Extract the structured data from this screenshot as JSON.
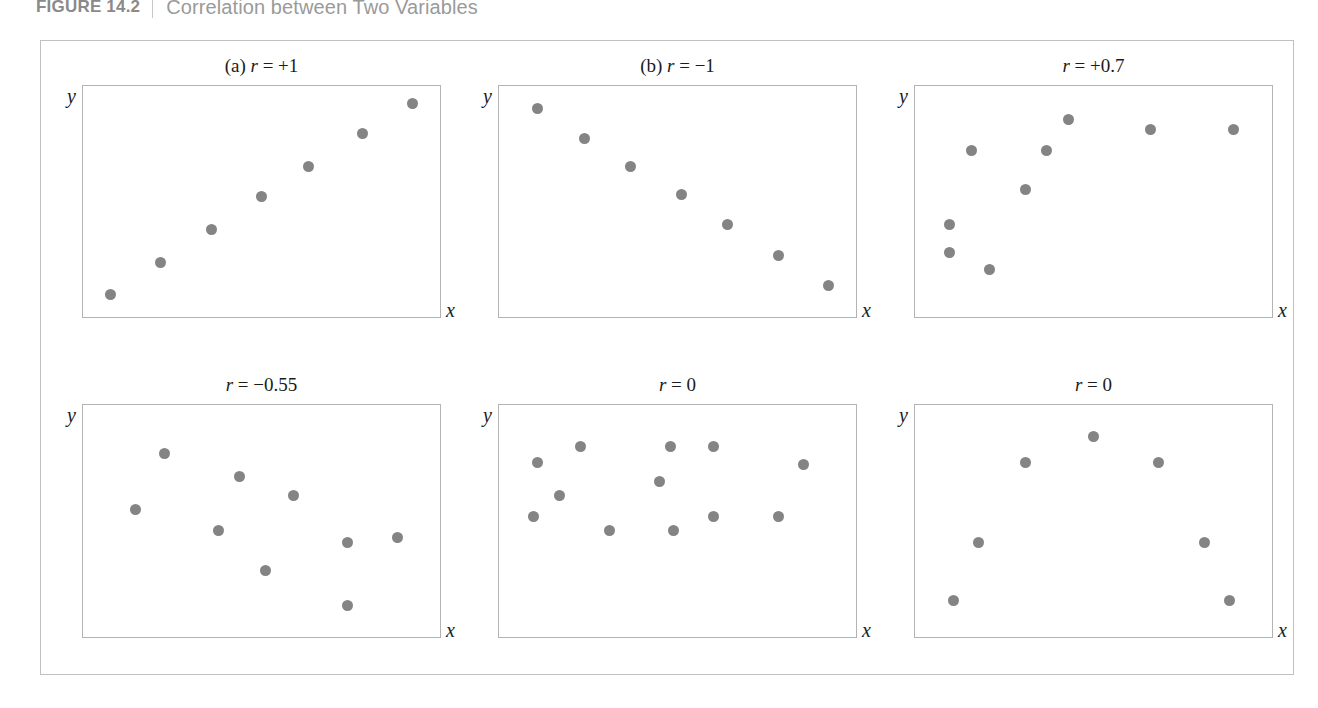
{
  "header": {
    "figure_label": "FIGURE 14.2",
    "title": "Correlation between Two Variables"
  },
  "axes": {
    "x_label": "x",
    "y_label": "y"
  },
  "chart_data": [
    {
      "type": "scatter",
      "panel_id": "panel-a",
      "title": "(a) r = +1",
      "r": "+1",
      "xlabel": "x",
      "ylabel": "y",
      "xlim": [
        0,
        100
      ],
      "ylim": [
        0,
        100
      ],
      "grid": false,
      "legend": "none",
      "points": [
        {
          "x": 8,
          "y": 10
        },
        {
          "x": 22,
          "y": 24
        },
        {
          "x": 36,
          "y": 38
        },
        {
          "x": 50,
          "y": 52
        },
        {
          "x": 63,
          "y": 65
        },
        {
          "x": 78,
          "y": 79
        },
        {
          "x": 92,
          "y": 92
        }
      ]
    },
    {
      "type": "scatter",
      "panel_id": "panel-b",
      "title": "(b) r = −1",
      "r": "−1",
      "xlabel": "x",
      "ylabel": "y",
      "xlim": [
        0,
        100
      ],
      "ylim": [
        0,
        100
      ],
      "grid": false,
      "legend": "none",
      "points": [
        {
          "x": 11,
          "y": 90
        },
        {
          "x": 24,
          "y": 77
        },
        {
          "x": 37,
          "y": 65
        },
        {
          "x": 51,
          "y": 53
        },
        {
          "x": 64,
          "y": 40
        },
        {
          "x": 78,
          "y": 27
        },
        {
          "x": 92,
          "y": 14
        }
      ]
    },
    {
      "type": "scatter",
      "panel_id": "panel-c",
      "title": "r = +0.7",
      "r": "+0.7",
      "xlabel": "x",
      "ylabel": "y",
      "xlim": [
        0,
        100
      ],
      "ylim": [
        0,
        100
      ],
      "grid": false,
      "legend": "none",
      "points": [
        {
          "x": 10,
          "y": 40
        },
        {
          "x": 10,
          "y": 28
        },
        {
          "x": 21,
          "y": 21
        },
        {
          "x": 16,
          "y": 72
        },
        {
          "x": 31,
          "y": 55
        },
        {
          "x": 37,
          "y": 72
        },
        {
          "x": 43,
          "y": 85
        },
        {
          "x": 66,
          "y": 81
        },
        {
          "x": 89,
          "y": 81
        }
      ]
    },
    {
      "type": "scatter",
      "panel_id": "panel-d",
      "title": "r = −0.55",
      "r": "−0.55",
      "xlabel": "x",
      "ylabel": "y",
      "xlim": [
        0,
        100
      ],
      "ylim": [
        0,
        100
      ],
      "grid": false,
      "legend": "none",
      "points": [
        {
          "x": 15,
          "y": 55
        },
        {
          "x": 23,
          "y": 79
        },
        {
          "x": 38,
          "y": 46
        },
        {
          "x": 44,
          "y": 69
        },
        {
          "x": 51,
          "y": 29
        },
        {
          "x": 59,
          "y": 61
        },
        {
          "x": 74,
          "y": 41
        },
        {
          "x": 74,
          "y": 14
        },
        {
          "x": 88,
          "y": 43
        }
      ]
    },
    {
      "type": "scatter",
      "panel_id": "panel-e",
      "title": "r = 0",
      "r": "0",
      "xlabel": "x",
      "ylabel": "y",
      "xlim": [
        0,
        100
      ],
      "ylim": [
        0,
        100
      ],
      "grid": false,
      "legend": "none",
      "points": [
        {
          "x": 11,
          "y": 75
        },
        {
          "x": 10,
          "y": 52
        },
        {
          "x": 17,
          "y": 61
        },
        {
          "x": 23,
          "y": 82
        },
        {
          "x": 31,
          "y": 46
        },
        {
          "x": 45,
          "y": 67
        },
        {
          "x": 48,
          "y": 82
        },
        {
          "x": 49,
          "y": 46
        },
        {
          "x": 60,
          "y": 82
        },
        {
          "x": 60,
          "y": 52
        },
        {
          "x": 78,
          "y": 52
        },
        {
          "x": 85,
          "y": 74
        }
      ]
    },
    {
      "type": "scatter",
      "panel_id": "panel-f",
      "title": "r = 0",
      "r": "0",
      "xlabel": "x",
      "ylabel": "y",
      "xlim": [
        0,
        100
      ],
      "ylim": [
        0,
        100
      ],
      "grid": false,
      "legend": "none",
      "points": [
        {
          "x": 11,
          "y": 16
        },
        {
          "x": 18,
          "y": 41
        },
        {
          "x": 31,
          "y": 75
        },
        {
          "x": 50,
          "y": 86
        },
        {
          "x": 68,
          "y": 75
        },
        {
          "x": 81,
          "y": 41
        },
        {
          "x": 88,
          "y": 16
        }
      ]
    }
  ]
}
